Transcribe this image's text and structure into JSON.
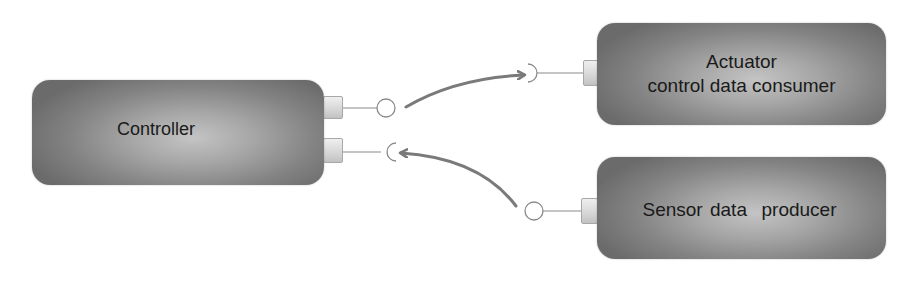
{
  "diagram": {
    "type": "component-interface-diagram",
    "components": [
      {
        "id": "controller",
        "label_lines": [
          "Controller"
        ],
        "ports": [
          {
            "id": "controller-out",
            "kind": "provided-interface",
            "symbol": "lollipop"
          },
          {
            "id": "controller-in",
            "kind": "required-interface",
            "symbol": "socket"
          }
        ]
      },
      {
        "id": "actuator",
        "label_lines": [
          "Actuator",
          "control data consumer"
        ],
        "ports": [
          {
            "id": "actuator-in",
            "kind": "required-interface",
            "symbol": "socket"
          }
        ]
      },
      {
        "id": "sensor",
        "label_lines": [
          "Sensor data  producer"
        ],
        "ports": [
          {
            "id": "sensor-out",
            "kind": "provided-interface",
            "symbol": "lollipop"
          }
        ]
      }
    ],
    "connections": [
      {
        "from": "controller-out",
        "to": "actuator-in",
        "style": "curved-arrow"
      },
      {
        "from": "sensor-out",
        "to": "controller-in",
        "style": "curved-arrow"
      }
    ],
    "colors": {
      "box_center": "#c4c4c4",
      "box_edge": "#6b6b6b",
      "port_fill": "#e0e0e0",
      "wire": "#777777",
      "arrow": "#7a7a7a",
      "text": "#1a1a1a",
      "background": "#ffffff"
    }
  }
}
